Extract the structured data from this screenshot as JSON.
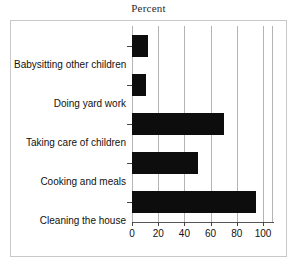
{
  "chart_data": {
    "type": "bar",
    "orientation": "horizontal",
    "title": "Percent",
    "xlabel": "",
    "ylabel": "",
    "categories": [
      "Babysitting other children",
      "Doing yard work",
      "Taking care of children",
      "Cooking and meals",
      "Cleaning the house"
    ],
    "values": [
      12,
      11,
      70,
      50,
      95
    ],
    "xlim": [
      0,
      100
    ],
    "xticks": [
      0,
      20,
      40,
      60,
      80,
      100
    ],
    "xtick_labels": [
      "0",
      "20",
      "40",
      "60",
      "80",
      "100"
    ],
    "grid": true,
    "grid_axis": "x",
    "legend": false,
    "bar_color": "#0d0d0d",
    "background_color": "#ffffff",
    "frame_color": "#c8c8c8"
  }
}
